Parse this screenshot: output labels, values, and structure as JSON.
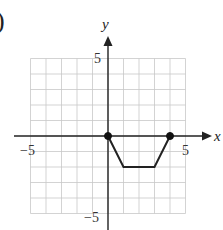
{
  "label_fragment": ")",
  "chart_data": {
    "type": "line",
    "title": "",
    "xlabel": "x",
    "ylabel": "y",
    "xlim": [
      -5,
      5
    ],
    "ylim": [
      -5,
      5
    ],
    "grid": true,
    "x_tick_labels": [
      "-5",
      "5"
    ],
    "y_tick_labels": [
      "5",
      "-5"
    ],
    "series": [
      {
        "name": "piecewise",
        "x": [
          0,
          1,
          3,
          4
        ],
        "y": [
          0,
          -2,
          -2,
          0
        ]
      }
    ],
    "endpoints": [
      {
        "x": 0,
        "y": 0,
        "filled": true
      },
      {
        "x": 4,
        "y": 0,
        "filled": true
      }
    ]
  },
  "axes": {
    "x_label": "x",
    "y_label": "y",
    "x_neg": "−5",
    "x_pos": "5",
    "y_pos": "5",
    "y_neg": "−5"
  }
}
